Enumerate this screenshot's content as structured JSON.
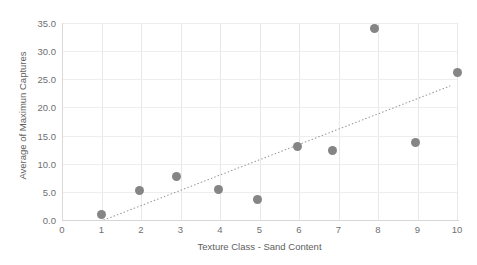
{
  "chart_data": {
    "type": "scatter",
    "title": "",
    "xlabel": "Texture Class - Sand Content",
    "ylabel": "Average of Maximun Captures",
    "xlim": [
      0,
      10
    ],
    "ylim": [
      0,
      35
    ],
    "grid": true,
    "legend": null,
    "xticks": [
      "0",
      "1",
      "2",
      "3",
      "4",
      "5",
      "6",
      "7",
      "8",
      "9",
      "10"
    ],
    "xtick_values": [
      0,
      1,
      2,
      3,
      4,
      5,
      6,
      7,
      8,
      9,
      10
    ],
    "yticks": [
      "0.0",
      "5.0",
      "10.0",
      "15.0",
      "20.0",
      "25.0",
      "30.0",
      "35.0"
    ],
    "ytick_values": [
      0,
      5,
      10,
      15,
      20,
      25,
      30,
      35
    ],
    "series": [
      {
        "name": "Average of Maximun Captures",
        "marker": "circle",
        "color": "#858585",
        "points": [
          {
            "x": 1.0,
            "y": 0.9
          },
          {
            "x": 1.95,
            "y": 5.3
          },
          {
            "x": 2.9,
            "y": 7.7
          },
          {
            "x": 3.95,
            "y": 5.5
          },
          {
            "x": 4.95,
            "y": 3.6
          },
          {
            "x": 5.95,
            "y": 13.1
          },
          {
            "x": 6.85,
            "y": 12.3
          },
          {
            "x": 7.9,
            "y": 34.0
          },
          {
            "x": 8.95,
            "y": 13.8
          },
          {
            "x": 10.0,
            "y": 26.2
          }
        ]
      }
    ],
    "trendline": {
      "name": "linear trend",
      "style": "dotted",
      "color": "#9a9a9a",
      "x0": 1.06,
      "y0": 0.0,
      "x1": 9.82,
      "y1": 23.8
    },
    "colors": {
      "marker": "#858585",
      "trendline": "#9a9a9a",
      "gridline": "#e8e8e8",
      "axis": "#d6d6d6",
      "tick_text": "#6f6f6f",
      "axis_title": "#5e5e5e",
      "background": "#ffffff"
    }
  }
}
